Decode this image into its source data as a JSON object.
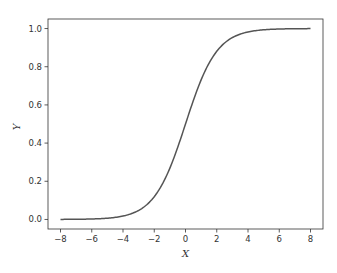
{
  "chart_data": {
    "type": "line",
    "title": "",
    "xlabel": "X",
    "ylabel": "Y",
    "xlim": [
      -8.8,
      8.8
    ],
    "ylim": [
      -0.05,
      1.05
    ],
    "grid": false,
    "x_ticks": [
      -8,
      -6,
      -4,
      -2,
      0,
      2,
      4,
      6,
      8
    ],
    "x_tick_labels": [
      "−8",
      "−6",
      "−4",
      "−2",
      "0",
      "2",
      "4",
      "6",
      "8"
    ],
    "y_ticks": [
      0.0,
      0.2,
      0.4,
      0.6,
      0.8,
      1.0
    ],
    "y_tick_labels": [
      "0.0",
      "0.2",
      "0.4",
      "0.6",
      "0.8",
      "1.0"
    ],
    "series": [
      {
        "name": "sigmoid",
        "color": "#555555",
        "function": "1/(1+exp(-x))",
        "x": [
          -8,
          -7,
          -6,
          -5,
          -4,
          -3,
          -2,
          -1,
          0,
          1,
          2,
          3,
          4,
          5,
          6,
          7,
          8
        ],
        "y": [
          0.0003,
          0.0009,
          0.0025,
          0.0067,
          0.018,
          0.047,
          0.119,
          0.269,
          0.5,
          0.731,
          0.881,
          0.953,
          0.982,
          0.9933,
          0.9975,
          0.9991,
          0.9997
        ]
      }
    ]
  }
}
